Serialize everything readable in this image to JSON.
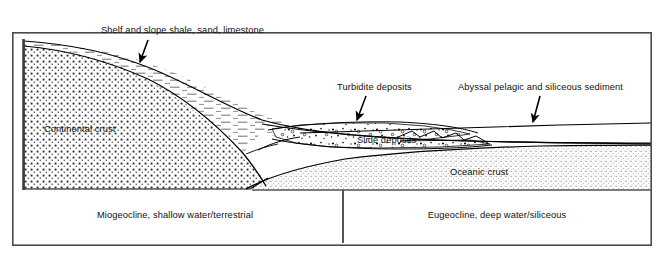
{
  "figure": {
    "type": "geologic-cross-section",
    "title_present": false,
    "background_color": "#ffffff",
    "line_color": "#000000",
    "frame": {
      "x": 12,
      "y": 32,
      "width": 640,
      "height": 214,
      "border_color": "#4a4a4a",
      "border_width": 1.6
    },
    "vertical_divider": {
      "x": 343,
      "y_top": 190,
      "y_bottom": 243,
      "color": "#555555",
      "width": 2
    },
    "left_margin_bar": {
      "x": 23,
      "y_top": 39,
      "y_bottom": 190,
      "color": "#444444",
      "width": 2.6
    }
  },
  "labels": {
    "shelf_slope": {
      "text": "Shelf and slope shale, sand, limestone",
      "x": 101,
      "y": 31,
      "anchor": "start"
    },
    "turbidite": {
      "text": "Turbidite deposits",
      "x": 337,
      "y": 88,
      "anchor": "start"
    },
    "abyssal": {
      "text": "Abyssal pelagic and siliceous sediment",
      "x": 458,
      "y": 88,
      "anchor": "start"
    },
    "continental_crust": {
      "text": "Continental crust",
      "x": 44,
      "y": 130,
      "anchor": "start"
    },
    "slide_deposits": {
      "text": "Slide deposits",
      "x": 357,
      "y": 141,
      "anchor": "start"
    },
    "oceanic_crust": {
      "text": "Oceanic crust",
      "x": 450,
      "y": 173,
      "anchor": "start"
    },
    "miogeocline": {
      "text": "Miogeocline, shallow water/terrestrial",
      "x": 175,
      "y": 216,
      "anchor": "middle"
    },
    "eugeocline": {
      "text": "Eugeocline, deep water/siliceous",
      "x": 497,
      "y": 216,
      "anchor": "middle"
    }
  },
  "units": [
    {
      "name": "continental-crust",
      "pattern": "coarse-cross-stipple",
      "fill_color": "#ffffff",
      "pattern_color": "#333333"
    },
    {
      "name": "shelf-slope-sediment",
      "pattern": "horizontal-dash",
      "fill_color": "#ffffff",
      "pattern_color": "#8a8a8a"
    },
    {
      "name": "slide-deposits",
      "pattern": "dots-and-circles",
      "fill_color": "#ffffff",
      "pattern_color": "#222222"
    },
    {
      "name": "oceanic-crust",
      "pattern": "fine-stipple",
      "fill_color": "#ffffff",
      "pattern_color": "#555555"
    },
    {
      "name": "abyssal-sediment",
      "pattern": "blank",
      "fill_color": "#ffffff",
      "pattern_color": "#000000"
    }
  ],
  "leader_arrows": [
    {
      "name": "shelf-slope-arrow",
      "from_x": 148,
      "from_y": 38,
      "to_x": 140,
      "to_y": 62
    },
    {
      "name": "turbidite-arrow",
      "from_x": 364,
      "from_y": 95,
      "to_x": 358,
      "to_y": 120
    },
    {
      "name": "abyssal-arrow",
      "from_x": 539,
      "from_y": 95,
      "to_x": 533,
      "to_y": 122
    }
  ]
}
